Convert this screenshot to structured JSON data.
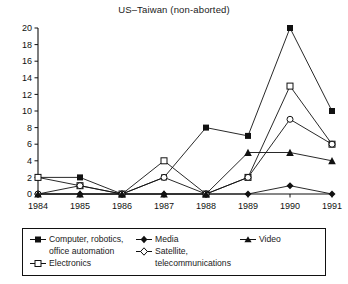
{
  "chart_data": {
    "type": "line",
    "title": "US–Taiwan (non-aborted)",
    "xlabel": "",
    "ylabel": "",
    "categories": [
      "1984",
      "1985",
      "1986",
      "1987",
      "1988",
      "1989",
      "1990",
      "1991"
    ],
    "x": [
      1984,
      1985,
      1986,
      1987,
      1988,
      1989,
      1990,
      1991
    ],
    "ylim": [
      0,
      20
    ],
    "yticks": [
      0,
      2,
      4,
      6,
      8,
      10,
      12,
      14,
      16,
      18,
      20
    ],
    "ytick_labels": [
      "0",
      "2",
      "4",
      "6",
      "8",
      "10",
      "12",
      "14",
      "16",
      "18",
      "20"
    ],
    "xtick_labels": [
      "1984",
      "1985",
      "1986",
      "1987",
      "1988",
      "1989",
      "1990",
      "1991"
    ],
    "grid": false,
    "legend_position": "below",
    "series": [
      {
        "name": "Computer, robotics, office automation",
        "marker": "filled-square",
        "values": [
          2,
          2,
          0,
          2,
          8,
          7,
          20,
          10
        ]
      },
      {
        "name": "Electronics",
        "marker": "open-square",
        "values": [
          2,
          1,
          0,
          4,
          0,
          2,
          13,
          6
        ]
      },
      {
        "name": "Media",
        "marker": "filled-diamond",
        "values": [
          0,
          0,
          0,
          0,
          0,
          0,
          1,
          0
        ]
      },
      {
        "name": "Satellite, telecommunications",
        "marker": "open-circle",
        "values": [
          0,
          1,
          0,
          2,
          0,
          2,
          9,
          6
        ]
      },
      {
        "name": "Video",
        "marker": "filled-triangle",
        "values": [
          0,
          0,
          0,
          0,
          0,
          5,
          5,
          4
        ]
      }
    ]
  },
  "legend": {
    "col1": {
      "item1_line1": "Computer, robotics,",
      "item1_line2": "office automation",
      "item2": "Electronics"
    },
    "col2": {
      "item1": "Media",
      "item2_line1": "Satellite,",
      "item2_line2": "telecommunications"
    },
    "col3": {
      "item1": "Video"
    }
  },
  "colors": {
    "ink": "#111111",
    "background": "#ffffff"
  }
}
